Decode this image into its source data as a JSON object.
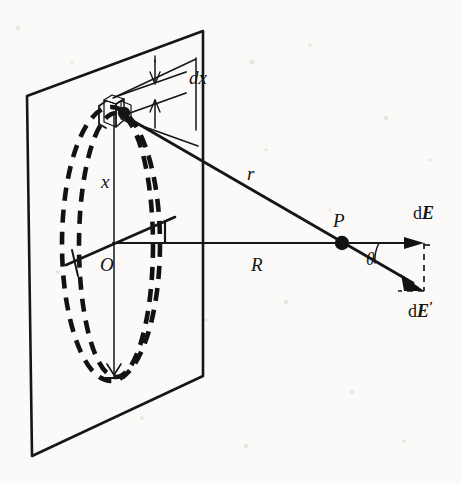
{
  "figure": {
    "type": "physics-vector-diagram",
    "background_color": "#fbfaf8",
    "ink_color": "#141414",
    "labels": {
      "dx": "dx",
      "x": "x",
      "center": "O",
      "r": "r",
      "R": "R",
      "point_p": "P",
      "theta": "θ",
      "dE": "d",
      "dE_sym": "E",
      "dE_prime": "d",
      "dE_prime_sym": "E",
      "dE_prime_mark": "′"
    },
    "elements": [
      {
        "name": "charged-plane",
        "label": "charged plane (parallelogram)",
        "style": "solid outline"
      },
      {
        "name": "ring-outer",
        "label": "outer ring radius x+dx",
        "style": "dashed ellipse"
      },
      {
        "name": "ring-inner",
        "label": "inner ring radius x",
        "style": "dashed ellipse"
      },
      {
        "name": "charge-element",
        "label": "charge element dq on ring",
        "style": "filled block"
      },
      {
        "name": "radius-x",
        "label": "radius x from O to element",
        "style": "solid line"
      },
      {
        "name": "distance-r",
        "label": "distance r from element to P",
        "style": "solid line"
      },
      {
        "name": "axis-R",
        "label": "axial distance R from O to P",
        "style": "solid line"
      },
      {
        "name": "field-dE",
        "label": "axial component dE",
        "style": "solid arrow"
      },
      {
        "name": "field-dE-prime",
        "label": "total field dE'",
        "style": "solid arrow"
      },
      {
        "name": "decomposition-box",
        "label": "dashed rectangle for vector components",
        "style": "dashed"
      }
    ],
    "geometry": {
      "plane_corners": [
        [
          27,
          96
        ],
        [
          203,
          31
        ],
        [
          203,
          376
        ],
        [
          32,
          456
        ]
      ],
      "center_O": [
        113,
        243
      ],
      "element_pos": [
        116,
        111
      ],
      "point_P": [
        342,
        243
      ],
      "dE_tip": [
        423,
        243
      ],
      "dE_prime_tip": [
        424,
        290
      ],
      "ring_outer_rx": 49,
      "ring_outer_ry": 137,
      "ring_inner_rx": 38,
      "ring_inner_ry": 132,
      "theta_deg": 30
    }
  }
}
